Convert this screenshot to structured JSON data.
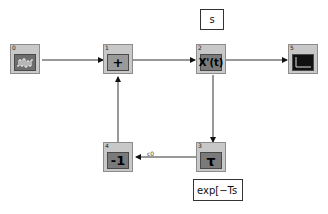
{
  "blocks": [
    {
      "index": "0",
      "symbol": "signal-generator",
      "glyph": ""
    },
    {
      "index": "1",
      "symbol": "sum",
      "glyph": "+"
    },
    {
      "index": "2",
      "symbol": "derivative",
      "glyph": "X'(t)"
    },
    {
      "index": "3",
      "symbol": "time-delay",
      "glyph": "τ"
    },
    {
      "index": "4",
      "symbol": "gain",
      "glyph": "-1"
    },
    {
      "index": "5",
      "symbol": "scope",
      "glyph": ""
    }
  ],
  "annotations": {
    "derivative_label": "s",
    "delay_label": "exp[−Ts"
  },
  "signals": {
    "feedback_label": "c0"
  },
  "colors": {
    "block_bg": "#c8c8c8",
    "inner_bg": "#7a7a7a",
    "wire": "#333333"
  }
}
